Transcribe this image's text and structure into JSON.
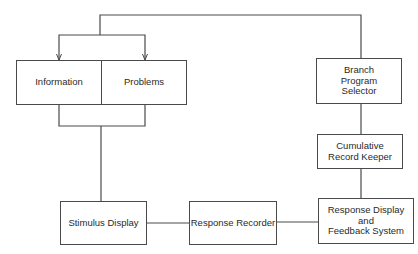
{
  "diagram": {
    "nodes": [
      {
        "id": "information",
        "label": "Information"
      },
      {
        "id": "problems",
        "label": "Problems"
      },
      {
        "id": "branch",
        "label": "Branch\nProgram\nSelector"
      },
      {
        "id": "cumulative",
        "label": "Cumulative\nRecord Keeper"
      },
      {
        "id": "stimulus",
        "label": "Stimulus Display"
      },
      {
        "id": "recorder",
        "label": "Response Recorder"
      },
      {
        "id": "feedback",
        "label": "Response Display\nand\nFeedback System"
      }
    ],
    "edges": [
      {
        "from": "branch",
        "to": "information",
        "arrow": true
      },
      {
        "from": "branch",
        "to": "problems",
        "arrow": true
      },
      {
        "from": "information",
        "to": "stimulus",
        "arrow": false
      },
      {
        "from": "problems",
        "to": "stimulus",
        "arrow": false
      },
      {
        "from": "stimulus",
        "to": "recorder",
        "arrow": false
      },
      {
        "from": "recorder",
        "to": "feedback",
        "arrow": false
      },
      {
        "from": "feedback",
        "to": "cumulative",
        "arrow": false
      },
      {
        "from": "cumulative",
        "to": "branch",
        "arrow": false
      }
    ],
    "colors": {
      "line": "#4a4a4a",
      "text": "#2a2a2a",
      "background": "#ffffff"
    }
  }
}
